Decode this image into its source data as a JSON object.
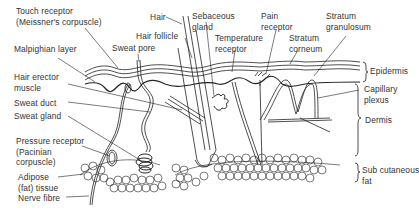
{
  "diagram": {
    "colors": {
      "line": "#222222",
      "text": "#333333",
      "background": "#ffffff"
    },
    "labels": {
      "touch_receptor": "Touch receptor\n(Meissner's corpuscle)",
      "hair": "Hair",
      "sebaceous_gland": "Sebaceous\ngland",
      "pain_receptor": "Pain\nreceptor",
      "stratum_granulosum": "Stratum\ngranulosum",
      "hair_follicle": "Hair follicle",
      "malpighian_layer": "Malpighian layer",
      "sweat_pore": "Sweat pore",
      "temperature_receptor": "Temperature\nreceptor",
      "stratum_corneum": "Stratum\ncorneum",
      "epidermis": "Epidermis",
      "hair_erector_muscle": "Hair erector\nmuscle",
      "capillary_plexus": "Capillary\nplexus",
      "sweat_duct": "Sweat duct",
      "sweat_gland": "Sweat gland",
      "dermis": "Dermis",
      "pressure_receptor": "Pressure receptor\n(Pacinian\ncorpuscle)",
      "adipose_tissue": "Adipose\n(fat) tissue",
      "subcutaneous_fat": "Sub cutaneous\nfat",
      "nerve_fibre": "Nerve fibre"
    },
    "layers": [
      "Epidermis",
      "Dermis",
      "Sub cutaneous fat"
    ]
  }
}
